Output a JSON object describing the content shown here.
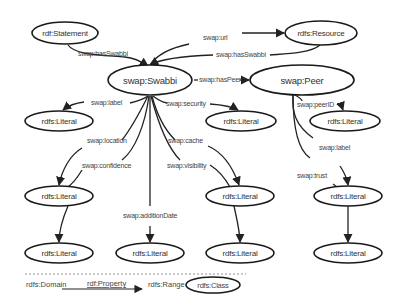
{
  "diagram": {
    "nodes": {
      "statement": "rdf:Statement",
      "resource": "rdfs:Resource",
      "swabbi": "swap:Swabbi",
      "peer": "swap:Peer",
      "lit_label": "rdfs:Literal",
      "lit_security": "rdfs:Literal",
      "lit_peerid": "rdfs:Literal",
      "lit_location": "rdfs:Literal",
      "lit_cache": "rdfs:Literal",
      "lit_peerlabel": "rdfs:Literal",
      "lit_confidence": "rdfs:Literal",
      "lit_additiondate": "rdfs:Literal",
      "lit_visibility": "rdfs:Literal",
      "lit_trust": "rdfs:Literal"
    },
    "edges": {
      "statement_hasswabbi": "swap:hasSwabbi",
      "url": "swap:url",
      "resource_hasswabbi": "swap:hasSwabbi",
      "haspeer": "swap:hasPeer",
      "label": "swap:label",
      "security": "swap:security",
      "peerid": "swap:peerID",
      "location": "swap:location",
      "cache": "swap:cache",
      "peerlabel": "swap:label",
      "confidence": "swap:confidence",
      "visibility": "swap:visibility",
      "trust": "swap:trust",
      "additiondate": "swap:additionDate"
    },
    "legend": {
      "domain": "rdfs:Domain",
      "property": "rdf:Property",
      "range": "rdfs:Range",
      "class": "rdfs:Class"
    }
  }
}
